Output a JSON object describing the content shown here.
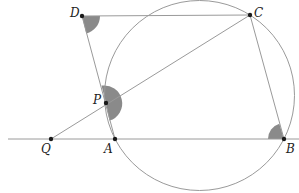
{
  "diagram": {
    "type": "geometry",
    "points": {
      "D": {
        "label": "D",
        "x": 82,
        "y": 16
      },
      "C": {
        "label": "C",
        "x": 250,
        "y": 15
      },
      "P": {
        "label": "P",
        "x": 106,
        "y": 103
      },
      "Q": {
        "label": "Q",
        "x": 51,
        "y": 139
      },
      "A": {
        "label": "A",
        "x": 115,
        "y": 139
      },
      "B": {
        "label": "B",
        "x": 284,
        "y": 139
      }
    },
    "circle": {
      "cx": 199.5,
      "cy": 95.5,
      "r": 95
    },
    "segments": [
      "DC",
      "DA",
      "CB",
      "QC",
      "line QB extended"
    ],
    "marked_angles": [
      "D",
      "P",
      "B"
    ],
    "colors": {
      "line": "#9a9a9a",
      "shade": "#8a8a8a",
      "point": "#1a1a1a"
    }
  }
}
